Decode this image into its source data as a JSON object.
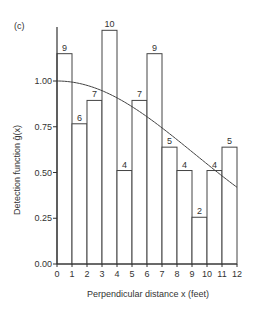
{
  "panel_label": "(c)",
  "chart_data": {
    "type": "bar",
    "title": "",
    "xlabel": "Perpendicular distance  x (feet)",
    "ylabel": "Detection function ĝ(x)",
    "xlim": [
      0,
      12
    ],
    "ylim": [
      0,
      1.3
    ],
    "x_ticks": [
      "0",
      "1",
      "2",
      "3",
      "4",
      "5",
      "6",
      "7",
      "8",
      "9",
      "10",
      "11",
      "12"
    ],
    "y_ticks": [
      "0.00",
      "0.25",
      "0.50",
      "0.75",
      "1.00"
    ],
    "y_tick_values": [
      0,
      0.25,
      0.5,
      0.75,
      1.0
    ],
    "bin_edges": [
      0,
      1,
      2,
      3,
      4,
      5,
      6,
      7,
      8,
      9,
      10,
      11,
      12
    ],
    "counts": [
      9,
      6,
      7,
      10,
      4,
      7,
      9,
      5,
      4,
      2,
      4,
      5
    ],
    "count_scale": 0.1277,
    "values": [
      1.15,
      0.766,
      0.894,
      1.277,
      0.511,
      0.894,
      1.15,
      0.639,
      0.511,
      0.255,
      0.511,
      0.639
    ],
    "fitted_curve": {
      "type": "half-normal",
      "sigma": 9.1,
      "g0": 1.0,
      "g12": 0.42
    },
    "grid": false,
    "legend": null
  }
}
